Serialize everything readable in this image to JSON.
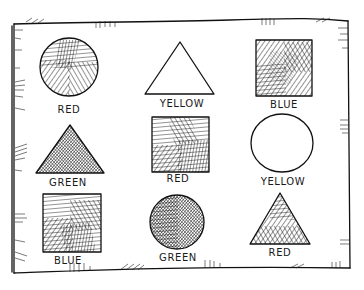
{
  "illustration": {
    "style": "hand-drawn pen sketch",
    "ink_color": "#111111",
    "background": "#ffffff",
    "grid": {
      "rows": 3,
      "cols": 3
    },
    "items": [
      {
        "shape": "circle",
        "fill": "hatched",
        "label": "RED"
      },
      {
        "shape": "triangle",
        "fill": "empty",
        "label": "YELLOW"
      },
      {
        "shape": "square",
        "fill": "hatched",
        "label": "BLUE"
      },
      {
        "shape": "triangle",
        "fill": "dense-hatched",
        "label": "GREEN"
      },
      {
        "shape": "square",
        "fill": "hatched",
        "label": "RED"
      },
      {
        "shape": "circle",
        "fill": "empty",
        "label": "YELLOW"
      },
      {
        "shape": "square",
        "fill": "hatched",
        "label": "BLUE"
      },
      {
        "shape": "circle",
        "fill": "dense-hatched",
        "label": "GREEN"
      },
      {
        "shape": "triangle",
        "fill": "hatched",
        "label": "RED"
      }
    ]
  }
}
